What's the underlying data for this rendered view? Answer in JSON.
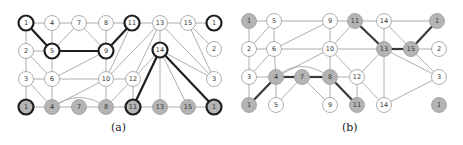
{
  "figure": {
    "panels": [
      {
        "id": "a",
        "caption": "(a)",
        "colors": {
          "edge": "#9a9a9a",
          "bold_edge": "#1e1e1e",
          "node_fill": "#ffffff",
          "node_fill_gray": "#b4b4b4",
          "node_stroke": "#9a9a9a",
          "bold_stroke": "#1e1e1e"
        },
        "nodes": [
          {
            "id": "a1t",
            "label": "1",
            "x": 26,
            "y": 23,
            "fill": "white",
            "bold": true
          },
          {
            "id": "a4t",
            "label": "4",
            "x": 52,
            "y": 23,
            "fill": "white",
            "bold": false
          },
          {
            "id": "a7t",
            "label": "7",
            "x": 79,
            "y": 23,
            "fill": "white",
            "bold": false
          },
          {
            "id": "a8t",
            "label": "8",
            "x": 106,
            "y": 23,
            "fill": "white",
            "bold": false
          },
          {
            "id": "a11t",
            "label": "11",
            "x": 132,
            "y": 23,
            "fill": "white",
            "bold": true
          },
          {
            "id": "a13t",
            "label": "13",
            "x": 160,
            "y": 23,
            "fill": "white",
            "bold": false
          },
          {
            "id": "a15t",
            "label": "15",
            "x": 188,
            "y": 23,
            "fill": "white",
            "bold": false
          },
          {
            "id": "a1r",
            "label": "1",
            "x": 214,
            "y": 23,
            "fill": "white",
            "bold": true
          },
          {
            "id": "a2",
            "label": "2",
            "x": 26,
            "y": 51,
            "fill": "white",
            "bold": false
          },
          {
            "id": "a5",
            "label": "5",
            "x": 52,
            "y": 51,
            "fill": "white",
            "bold": true
          },
          {
            "id": "a9",
            "label": "9",
            "x": 106,
            "y": 51,
            "fill": "white",
            "bold": true
          },
          {
            "id": "a14",
            "label": "14",
            "x": 160,
            "y": 50,
            "fill": "white",
            "bold": true
          },
          {
            "id": "a2r",
            "label": "2",
            "x": 214,
            "y": 49,
            "fill": "white",
            "bold": false
          },
          {
            "id": "a3",
            "label": "3",
            "x": 26,
            "y": 79,
            "fill": "white",
            "bold": false
          },
          {
            "id": "a6",
            "label": "6",
            "x": 52,
            "y": 79,
            "fill": "white",
            "bold": false
          },
          {
            "id": "a10",
            "label": "10",
            "x": 106,
            "y": 79,
            "fill": "white",
            "bold": false
          },
          {
            "id": "a12",
            "label": "12",
            "x": 133,
            "y": 79,
            "fill": "white",
            "bold": false
          },
          {
            "id": "a3r",
            "label": "3",
            "x": 214,
            "y": 79,
            "fill": "white",
            "bold": false
          },
          {
            "id": "a1b",
            "label": "1",
            "x": 26,
            "y": 107,
            "fill": "gray",
            "bold": true
          },
          {
            "id": "a4b",
            "label": "4",
            "x": 52,
            "y": 107,
            "fill": "gray",
            "bold": false
          },
          {
            "id": "a7b",
            "label": "7",
            "x": 79,
            "y": 107,
            "fill": "gray",
            "bold": false
          },
          {
            "id": "a8b",
            "label": "8",
            "x": 106,
            "y": 107,
            "fill": "gray",
            "bold": false
          },
          {
            "id": "a11b",
            "label": "11",
            "x": 133,
            "y": 107,
            "fill": "gray",
            "bold": true
          },
          {
            "id": "a13b",
            "label": "13",
            "x": 160,
            "y": 107,
            "fill": "gray",
            "bold": false
          },
          {
            "id": "a15b",
            "label": "15",
            "x": 188,
            "y": 107,
            "fill": "gray",
            "bold": false
          },
          {
            "id": "a1br",
            "label": "1",
            "x": 214,
            "y": 107,
            "fill": "gray",
            "bold": true
          }
        ],
        "edges": [
          [
            "a1t",
            "a4t",
            false
          ],
          [
            "a4t",
            "a7t",
            false
          ],
          [
            "a7t",
            "a8t",
            false
          ],
          [
            "a8t",
            "a11t",
            false
          ],
          [
            "a11t",
            "a13t",
            false
          ],
          [
            "a13t",
            "a15t",
            false
          ],
          [
            "a15t",
            "a1r",
            false
          ],
          [
            "a1t",
            "a5",
            true
          ],
          [
            "a1t",
            "a2",
            false
          ],
          [
            "a4t",
            "a5",
            false
          ],
          [
            "a7t",
            "a5",
            false
          ],
          [
            "a7t",
            "a9",
            false
          ],
          [
            "a8t",
            "a9",
            false
          ],
          [
            "a11t",
            "a9",
            true
          ],
          [
            "a5",
            "a9",
            true
          ],
          [
            "a2",
            "a5",
            false
          ],
          [
            "a2",
            "a3",
            false
          ],
          [
            "a2",
            "a6",
            false
          ],
          [
            "a5",
            "a6",
            false
          ],
          [
            "a6",
            "a9",
            false
          ],
          [
            "a11t",
            "a10",
            false
          ],
          [
            "a13t",
            "a10",
            false
          ],
          [
            "a13t",
            "a12",
            false
          ],
          [
            "a13t",
            "a14",
            false
          ],
          [
            "a13t",
            "a3r",
            false
          ],
          [
            "a15t",
            "a2r",
            false
          ],
          [
            "a15t",
            "a3r",
            false
          ],
          [
            "a14",
            "a12",
            false
          ],
          [
            "a14",
            "a3r",
            false
          ],
          [
            "a14",
            "a11b",
            true
          ],
          [
            "a14",
            "a13b",
            false
          ],
          [
            "a14",
            "a15b",
            false
          ],
          [
            "a14",
            "a1br",
            true
          ],
          [
            "a3",
            "a6",
            false
          ],
          [
            "a6",
            "a10",
            false
          ],
          [
            "a9",
            "a10",
            false
          ],
          [
            "a10",
            "a12",
            false
          ],
          [
            "a3",
            "a1b",
            false
          ],
          [
            "a3",
            "a4b",
            false
          ],
          [
            "a6",
            "a4b",
            false
          ],
          [
            "a10",
            "a4b",
            false
          ],
          [
            "a10",
            "a8b",
            false
          ],
          [
            "a12",
            "a8b",
            false
          ],
          [
            "a12",
            "a11b",
            false
          ],
          [
            "a1b",
            "a4b",
            false
          ],
          [
            "a4b",
            "a7b",
            false
          ],
          [
            "a7b",
            "a8b",
            false
          ],
          [
            "a8b",
            "a11b",
            false
          ],
          [
            "a11b",
            "a13b",
            false
          ],
          [
            "a13b",
            "a15b",
            false
          ],
          [
            "a15b",
            "a1br",
            false
          ]
        ],
        "curved_edges": [
          {
            "from": "a4b",
            "to": "a8b",
            "path": "M52,107 Q80,88 106,107",
            "bold": false
          }
        ]
      },
      {
        "id": "b",
        "caption": "(b)",
        "colors": {
          "edge": "#9a9a9a",
          "bold_edge": "#3a3a3a",
          "node_fill": "#ffffff",
          "node_fill_gray": "#b4b4b4",
          "node_stroke": "#9a9a9a",
          "bold_stroke": "#9a9a9a"
        },
        "nodes": [
          {
            "id": "b1t",
            "label": "1",
            "x": 249,
            "y": 21,
            "fill": "gray",
            "bold": false
          },
          {
            "id": "b5t",
            "label": "5",
            "x": 274,
            "y": 21,
            "fill": "white",
            "bold": false
          },
          {
            "id": "b9t",
            "label": "9",
            "x": 330,
            "y": 21,
            "fill": "white",
            "bold": false
          },
          {
            "id": "b11t",
            "label": "11",
            "x": 355,
            "y": 21,
            "fill": "gray",
            "bold": false
          },
          {
            "id": "b14t",
            "label": "14",
            "x": 384,
            "y": 21,
            "fill": "white",
            "bold": false
          },
          {
            "id": "b1r",
            "label": "1",
            "x": 437,
            "y": 21,
            "fill": "gray",
            "bold": false
          },
          {
            "id": "b2",
            "label": "2",
            "x": 249,
            "y": 49,
            "fill": "white",
            "bold": false
          },
          {
            "id": "b6",
            "label": "6",
            "x": 274,
            "y": 49,
            "fill": "white",
            "bold": false
          },
          {
            "id": "b10",
            "label": "10",
            "x": 330,
            "y": 49,
            "fill": "white",
            "bold": false
          },
          {
            "id": "b13",
            "label": "13",
            "x": 384,
            "y": 49,
            "fill": "gray",
            "bold": false
          },
          {
            "id": "b15",
            "label": "15",
            "x": 411,
            "y": 49,
            "fill": "gray",
            "bold": false
          },
          {
            "id": "b2r",
            "label": "2",
            "x": 439,
            "y": 49,
            "fill": "white",
            "bold": false
          },
          {
            "id": "b3",
            "label": "3",
            "x": 249,
            "y": 77,
            "fill": "white",
            "bold": false
          },
          {
            "id": "b4",
            "label": "4",
            "x": 276,
            "y": 77,
            "fill": "gray",
            "bold": false
          },
          {
            "id": "b7",
            "label": "7",
            "x": 302,
            "y": 77,
            "fill": "gray",
            "bold": false
          },
          {
            "id": "b8",
            "label": "8",
            "x": 330,
            "y": 77,
            "fill": "gray",
            "bold": false
          },
          {
            "id": "b12",
            "label": "12",
            "x": 357,
            "y": 77,
            "fill": "white",
            "bold": false
          },
          {
            "id": "b3r",
            "label": "3",
            "x": 439,
            "y": 77,
            "fill": "white",
            "bold": false
          },
          {
            "id": "b1b",
            "label": "1",
            "x": 249,
            "y": 105,
            "fill": "gray",
            "bold": false
          },
          {
            "id": "b5b",
            "label": "5",
            "x": 276,
            "y": 105,
            "fill": "white",
            "bold": false
          },
          {
            "id": "b9b",
            "label": "9",
            "x": 330,
            "y": 105,
            "fill": "white",
            "bold": false
          },
          {
            "id": "b11b",
            "label": "11",
            "x": 357,
            "y": 105,
            "fill": "gray",
            "bold": false
          },
          {
            "id": "b14b",
            "label": "14",
            "x": 384,
            "y": 105,
            "fill": "white",
            "bold": false
          },
          {
            "id": "b1br",
            "label": "1",
            "x": 439,
            "y": 105,
            "fill": "gray",
            "bold": false
          }
        ],
        "edges": [
          [
            "b1t",
            "b5t",
            false
          ],
          [
            "b5t",
            "b9t",
            false
          ],
          [
            "b9t",
            "b11t",
            false
          ],
          [
            "b11t",
            "b14t",
            false
          ],
          [
            "b14t",
            "b1r",
            false
          ],
          [
            "b1t",
            "b2",
            false
          ],
          [
            "b5t",
            "b2",
            false
          ],
          [
            "b5t",
            "b6",
            false
          ],
          [
            "b9t",
            "b6",
            false
          ],
          [
            "b9t",
            "b10",
            false
          ],
          [
            "b11t",
            "b10",
            false
          ],
          [
            "b11t",
            "b13",
            true
          ],
          [
            "b14t",
            "b13",
            false
          ],
          [
            "b14t",
            "b15",
            false
          ],
          [
            "b1r",
            "b15",
            true
          ],
          [
            "b2",
            "b6",
            false
          ],
          [
            "b2",
            "b3",
            false
          ],
          [
            "b6",
            "b3",
            false
          ],
          [
            "b6",
            "b4",
            false
          ],
          [
            "b6",
            "b10",
            false
          ],
          [
            "b10",
            "b13",
            false
          ],
          [
            "b13",
            "b15",
            true
          ],
          [
            "b15",
            "b2r",
            false
          ],
          [
            "b15",
            "b3r",
            false
          ],
          [
            "b13",
            "b3r",
            false
          ],
          [
            "b10",
            "b4",
            false
          ],
          [
            "b10",
            "b8",
            false
          ],
          [
            "b10",
            "b12",
            false
          ],
          [
            "b13",
            "b12",
            false
          ],
          [
            "b13",
            "b14b",
            false
          ],
          [
            "b3",
            "b4",
            false
          ],
          [
            "b4",
            "b7",
            true
          ],
          [
            "b7",
            "b8",
            true
          ],
          [
            "b8",
            "b12",
            false
          ],
          [
            "b3",
            "b1b",
            false
          ],
          [
            "b4",
            "b1b",
            true
          ],
          [
            "b4",
            "b5b",
            false
          ],
          [
            "b7",
            "b5b",
            false
          ],
          [
            "b7",
            "b9b",
            false
          ],
          [
            "b8",
            "b9b",
            false
          ],
          [
            "b8",
            "b11b",
            true
          ],
          [
            "b12",
            "b11b",
            false
          ],
          [
            "b12",
            "b14b",
            false
          ],
          [
            "b14b",
            "b3r",
            false
          ]
        ],
        "curved_edges": [
          {
            "from": "b4",
            "to": "b8",
            "path": "M276,77 Q300,56 330,77",
            "bold": false
          }
        ]
      }
    ]
  }
}
